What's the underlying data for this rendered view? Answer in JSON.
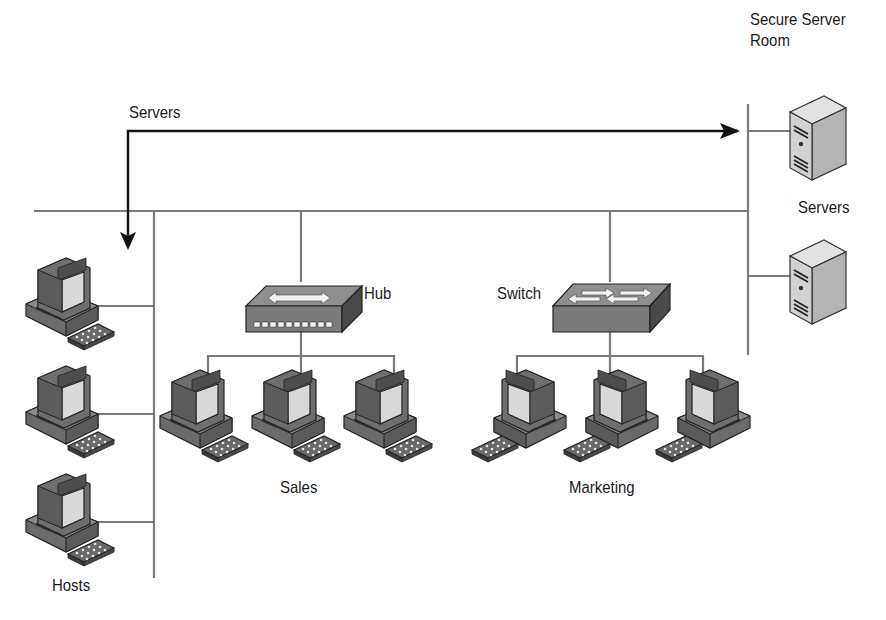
{
  "labels": {
    "secure_server_room_line1": "Secure Server",
    "secure_server_room_line2": "Room",
    "servers_arrow": "Servers",
    "servers_group": "Servers",
    "hub": "Hub",
    "switch": "Switch",
    "sales": "Sales",
    "marketing": "Marketing",
    "hosts": "Hosts"
  },
  "colors": {
    "line": "#7a7a7a",
    "arrow": "#111111",
    "device_dark": "#555555",
    "device_mid": "#8c8c8c",
    "device_light": "#cfcfcf",
    "screen": "#d6d6d6"
  },
  "groups": {
    "hosts": {
      "count": 3,
      "icon": "desktop-computer-icon"
    },
    "sales": {
      "count": 3,
      "icon": "desktop-computer-icon",
      "via": "hub"
    },
    "marketing": {
      "count": 3,
      "icon": "desktop-computer-icon",
      "via": "switch"
    },
    "servers": {
      "count": 2,
      "icon": "tower-server-icon"
    }
  }
}
